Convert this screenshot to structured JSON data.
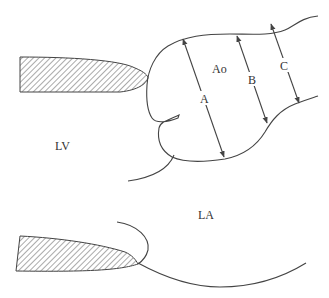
{
  "diagram": {
    "labels": {
      "aorta": "Ao",
      "left_ventricle": "LV",
      "left_atrium": "LA",
      "measure_a": "A",
      "measure_b": "B",
      "measure_c": "C"
    },
    "colors": {
      "stroke": "#444444",
      "hatch": "#555555",
      "background": "#ffffff"
    }
  }
}
